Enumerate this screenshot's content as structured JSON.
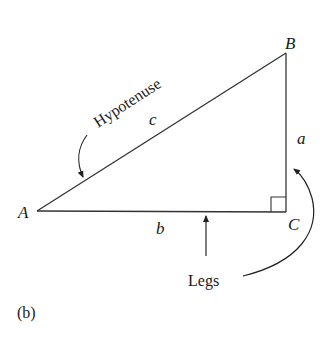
{
  "figure": {
    "panel_label": "(b)",
    "vertices": {
      "A": {
        "label": "A"
      },
      "B": {
        "label": "B"
      },
      "C": {
        "label": "C"
      }
    },
    "sides": {
      "a": {
        "label": "a"
      },
      "b": {
        "label": "b"
      },
      "c": {
        "label": "c"
      }
    },
    "annotations": {
      "hypotenuse": "Hypotenuse",
      "legs": "Legs"
    },
    "colors": {
      "stroke": "#333333",
      "text": "#1a1a1a",
      "background": "#ffffff"
    }
  }
}
